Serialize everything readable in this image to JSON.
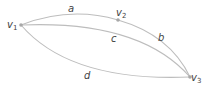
{
  "diagram": {
    "type": "graph",
    "colors": {
      "edge": "#bdbdbd",
      "vertex": "#a8a8a8",
      "label": "#444444"
    },
    "vertices": [
      {
        "id": "v1",
        "base": "v",
        "sub": "1"
      },
      {
        "id": "v2",
        "base": "v",
        "sub": "2"
      },
      {
        "id": "v3",
        "base": "v",
        "sub": "3"
      }
    ],
    "edges": [
      {
        "label": "a",
        "from": "v1",
        "to": "v2"
      },
      {
        "label": "b",
        "from": "v2",
        "to": "v3"
      },
      {
        "label": "c",
        "from": "v1",
        "to": "v3"
      },
      {
        "label": "d",
        "from": "v1",
        "to": "v3"
      }
    ]
  }
}
